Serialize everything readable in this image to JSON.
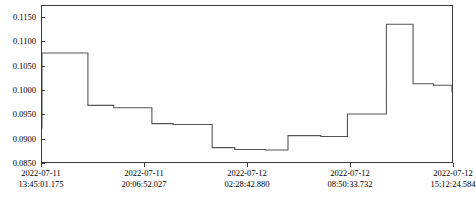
{
  "chart_data": {
    "type": "line",
    "line_style": "step-post",
    "title": "",
    "xlabel": "",
    "ylabel": "",
    "grid": false,
    "legend": null,
    "line_color": "#555555",
    "axis_color": "#3c3c3c",
    "background": "#ffffff",
    "ylim": [
      0.085,
      0.1175
    ],
    "yticks": [
      0.085,
      0.09,
      0.095,
      0.1,
      0.105,
      0.11,
      0.115
    ],
    "ytick_labels": [
      "0.0850",
      "0.0900",
      "0.0950",
      "0.1000",
      "0.1050",
      "0.1100",
      "0.1150"
    ],
    "xtick_labels": [
      {
        "date": "2022-07-11",
        "time": "13:45:01.175"
      },
      {
        "date": "2022-07-11",
        "time": "20:06:52.027"
      },
      {
        "date": "2022-07-12",
        "time": "02:28:42.880"
      },
      {
        "date": "2022-07-12",
        "time": "08:50:33.732"
      },
      {
        "date": "2022-07-12",
        "time": "15:12:24.584"
      }
    ],
    "xtick_fracs": [
      0.0,
      0.25,
      0.5,
      0.75,
      1.0
    ],
    "x": [
      0.0,
      0.112,
      0.175,
      0.268,
      0.32,
      0.415,
      0.47,
      0.545,
      0.6,
      0.68,
      0.745,
      0.84,
      0.905,
      0.955,
      1.0
    ],
    "y": [
      0.092,
      0.1077,
      0.0968,
      0.0963,
      0.093,
      0.0928,
      0.088,
      0.0876,
      0.0875,
      0.0905,
      0.0903,
      0.095,
      0.1137,
      0.1013,
      0.101,
      0.0995
    ]
  }
}
